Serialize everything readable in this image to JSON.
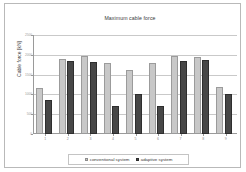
{
  "chart_data": {
    "type": "bar",
    "title": "Maximum cable force",
    "xlabel": "",
    "ylabel": "Cable force  [kN]",
    "categories": [
      "1",
      "2",
      "3",
      "4",
      "5",
      "6",
      "7",
      "8",
      "9"
    ],
    "series": [
      {
        "name": "conventional system",
        "color": "#c8c8c8",
        "values": [
          1150,
          1900,
          1960,
          1800,
          1620,
          1800,
          1980,
          1940,
          1190
        ]
      },
      {
        "name": "adaptive system",
        "color": "#474747",
        "values": [
          870,
          1850,
          1830,
          720,
          1000,
          720,
          1840,
          1880,
          1010
        ]
      }
    ],
    "ylim": [
      0,
      2500
    ],
    "yticks": [
      0,
      500,
      1000,
      1500,
      2000,
      2500
    ],
    "ytick_labels": [
      "0",
      "500",
      "1000",
      "1500",
      "2000",
      "2500"
    ],
    "grid": true,
    "legend_position": "bottom"
  },
  "legend": {
    "items": [
      {
        "label": "conventional system",
        "marker": "legend-swatch-conventional"
      },
      {
        "label": "adaptive system",
        "marker": "legend-swatch-adaptive"
      }
    ]
  }
}
